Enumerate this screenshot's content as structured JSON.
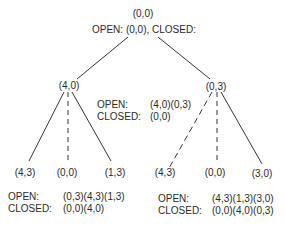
{
  "tree": {
    "root": {
      "label": "(0,0)",
      "status": "OPEN:  (0,0), CLOSED:"
    },
    "level1": {
      "left": {
        "label": "(4,0)"
      },
      "right": {
        "label": "(0,3)"
      },
      "lists": {
        "open_label": "OPEN:",
        "open_value": "(4,0)(0,3)",
        "closed_label": "CLOSED:",
        "closed_value": "(0,0)"
      }
    },
    "level2": {
      "left_children": [
        {
          "label": "(4,3)",
          "edge": "solid"
        },
        {
          "label": "(0,0)",
          "edge": "dashed"
        },
        {
          "label": "(1,3)",
          "edge": "solid"
        }
      ],
      "right_children": [
        {
          "label": "(4,3)",
          "edge": "dashed"
        },
        {
          "label": "(0,0)",
          "edge": "dashed"
        },
        {
          "label": "(3,0)",
          "edge": "solid"
        }
      ],
      "left_lists": {
        "open_label": "OPEN:",
        "open_value": "(0,3)(4,3)(1,3)",
        "closed_label": "CLOSED:",
        "closed_value": "(0,0)(4,0)"
      },
      "right_lists": {
        "open_label": "OPEN:",
        "open_value": "(4,3)(1,3)(3,0)",
        "closed_label": "CLOSED:",
        "closed_value": "(0,0)(4,0)(0,3)"
      }
    }
  }
}
